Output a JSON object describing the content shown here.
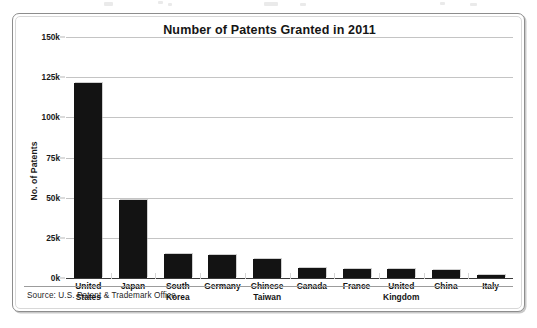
{
  "figure": {
    "title": "Number of Patents Granted in 2011",
    "source_note": "Source: U.S. Patent & Trademark Office"
  },
  "chart_data": {
    "type": "bar",
    "title": "Number of Patents Granted in 2011",
    "xlabel": "",
    "ylabel": "No. of Patents",
    "categories": [
      "United States",
      "Japan",
      "South Korea",
      "Germany",
      "Chinese Taiwan",
      "Canada",
      "France",
      "United Kingdom",
      "China",
      "Italy"
    ],
    "category_lines": [
      [
        "United",
        "States"
      ],
      [
        "Japan"
      ],
      [
        "South",
        "Korea"
      ],
      [
        "Germany"
      ],
      [
        "Chinese",
        "Taiwan"
      ],
      [
        "Canada"
      ],
      [
        "France"
      ],
      [
        "United",
        "Kingdom"
      ],
      [
        "China"
      ],
      [
        "Italy"
      ]
    ],
    "values": [
      121500,
      48500,
      14700,
      14400,
      11700,
      6100,
      5800,
      5800,
      4900,
      2100
    ],
    "ylim": [
      0,
      150000
    ],
    "ytick_values": [
      0,
      25000,
      50000,
      75000,
      100000,
      125000,
      150000
    ],
    "ytick_labels": [
      "0k",
      "25k",
      "50k",
      "75k",
      "100k",
      "125k",
      "150k"
    ],
    "grid": true,
    "legend": null,
    "bar_color": "#131313",
    "gridline_color": "#c4c4c4",
    "axis_color": "#3a3a3a",
    "background": "#ffffff"
  }
}
